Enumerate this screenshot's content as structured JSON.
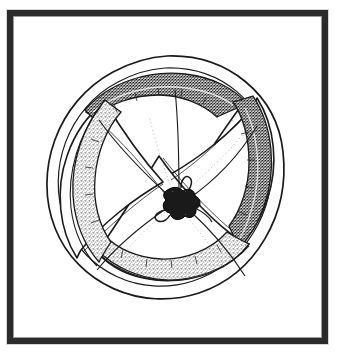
{
  "document": {
    "type": "line-drawing-illustration",
    "title": "Framed rosette / pinwheel illustration",
    "background_color": "#ffffff",
    "has_text": false,
    "caption": ""
  },
  "frame": {
    "name": "picture-frame",
    "border_color": "#2b2b2b",
    "border_width_px": 6,
    "inner_hairline_color": "#9a9a9a",
    "mat_color": "#ffffff",
    "x": 7,
    "y": 10,
    "width": 321,
    "height": 334
  },
  "artwork": {
    "subject": "rosette",
    "description": "Hand-drawn pen-and-ink rosette: a circular dome-like form with four broad petal lobes spiralling out from a small knotted centre, the rim broken by four shaded arc bands.",
    "ink_color": "#1a1a1a",
    "stipple_light_color": "#6f6f6f",
    "stipple_dark_color": "#2a2a2a",
    "paper_color": "#ffffff",
    "center": {
      "cx": 168,
      "cy": 188
    },
    "outer_circle": {
      "cx": 168,
      "cy": 185,
      "rx": 118,
      "ry": 115
    },
    "inner_circle": {
      "cx": 168,
      "cy": 186,
      "rx": 105,
      "ry": 103
    },
    "lobe_count": 4,
    "band_count": 4,
    "spiral_direction": "counter-clockwise",
    "knot": {
      "name": "center-knot",
      "description": "small tied knot where all lobe edges converge",
      "radius_px": 13
    },
    "lobes": [
      {
        "id": "lobe-top",
        "label": "top petal",
        "tip_angle_deg": 270,
        "shading": "clear"
      },
      {
        "id": "lobe-right",
        "label": "right petal",
        "tip_angle_deg": 0,
        "shading": "clear"
      },
      {
        "id": "lobe-bottom",
        "label": "bottom petal",
        "tip_angle_deg": 90,
        "shading": "clear"
      },
      {
        "id": "lobe-left",
        "label": "left petal",
        "tip_angle_deg": 180,
        "shading": "clear"
      }
    ],
    "rim_bands": [
      {
        "id": "band-top",
        "label": "top rim band",
        "texture": "dense-dark-stipple",
        "fill": "#3a3a3a",
        "angle_start_deg": 252,
        "angle_end_deg": 312
      },
      {
        "id": "band-right",
        "label": "right rim band",
        "texture": "dense-dark-stipple",
        "fill": "#3a3a3a",
        "angle_start_deg": 342,
        "angle_end_deg": 42
      },
      {
        "id": "band-bottom",
        "label": "bottom rim band",
        "texture": "light-stipple",
        "fill": "#8d8d8d",
        "angle_start_deg": 72,
        "angle_end_deg": 132
      },
      {
        "id": "band-left",
        "label": "left rim band",
        "texture": "light-stipple",
        "fill": "#8d8d8d",
        "angle_start_deg": 162,
        "angle_end_deg": 222
      }
    ],
    "hatch_groups": [
      {
        "id": "hatch-upper-left",
        "label": "upper-left shading strokes"
      },
      {
        "id": "hatch-upper-right",
        "label": "upper-right shading strokes"
      },
      {
        "id": "hatch-lower-right",
        "label": "lower-right shading strokes"
      },
      {
        "id": "hatch-lower-left",
        "label": "lower-left shading strokes"
      }
    ]
  }
}
